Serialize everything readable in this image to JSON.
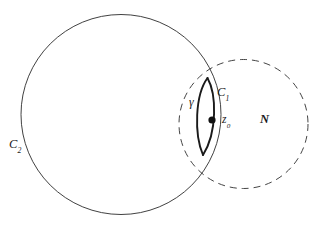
{
  "figure": {
    "width": 319,
    "height": 227,
    "background_color": "#ffffff",
    "stroke_color": "#2b2b2b",
    "labels": {
      "c2": "C",
      "c2_sub": "2",
      "c1": "C",
      "c1_sub": "1",
      "z0": "z",
      "z0_sub": "0",
      "gamma": "γ",
      "n": "N"
    },
    "geometry": {
      "circle_c2": {
        "label": "C2",
        "style": "solid",
        "center_x": 121,
        "center_y": 114.5,
        "radius": 100,
        "stroke_width": 0.9
      },
      "circle_n": {
        "label": "N",
        "style": "dashed",
        "center_x": 243.5,
        "center_y": 124,
        "radius": 64.5,
        "stroke_width": 0.9,
        "dash_pattern": "7 5"
      },
      "point_z0": {
        "label": "z0",
        "x": 212,
        "y": 120,
        "radius": 3.6,
        "fill": "#111111"
      },
      "lens_top_cusp": {
        "x": 207.5,
        "y": 78
      },
      "lens_bottom_cusp": {
        "x": 203,
        "y": 155
      },
      "arc_gamma": {
        "label": "gamma",
        "style": "solid-thick",
        "stroke_width": 1.9,
        "bulge_direction": "left"
      },
      "arc_c1": {
        "label": "C1",
        "style": "solid-thick",
        "stroke_width": 1.9,
        "bulge_direction": "right"
      }
    },
    "label_positions": {
      "c2": {
        "x": 17,
        "y": 145
      },
      "c1": {
        "x": 223,
        "y": 93
      },
      "z0": {
        "x": 227,
        "y": 121
      },
      "gamma": {
        "x": 193,
        "y": 103
      },
      "n": {
        "x": 265,
        "y": 120
      }
    }
  }
}
